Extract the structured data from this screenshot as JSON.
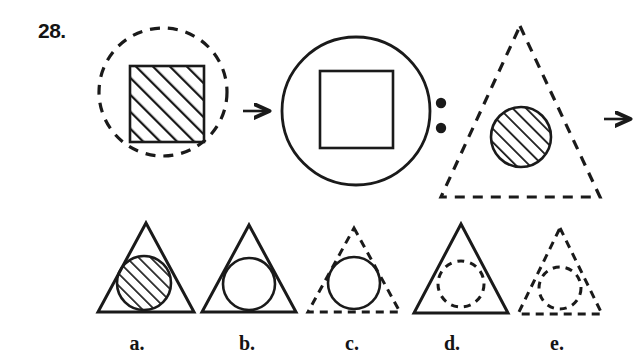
{
  "question": {
    "number_label": "28.",
    "type": "visual-analogy",
    "relation_symbol": ":",
    "transform_arrow": "→"
  },
  "colors": {
    "ink": "#1a1a1a",
    "background": "#ffffff",
    "hatch": "#1a1a1a"
  },
  "prompt": {
    "term1": {
      "name": "dashed-circle-with-hatched-square",
      "outer": {
        "shape": "circle",
        "stroke": "dashed",
        "fill": "none"
      },
      "inner": {
        "shape": "square",
        "stroke": "solid",
        "fill": "diagonal-hatch"
      }
    },
    "term2": {
      "name": "solid-circle-with-plain-square",
      "outer": {
        "shape": "circle",
        "stroke": "solid",
        "fill": "none"
      },
      "inner": {
        "shape": "square",
        "stroke": "solid",
        "fill": "none"
      }
    },
    "term3": {
      "name": "dashed-triangle-with-hatched-circle",
      "outer": {
        "shape": "triangle",
        "stroke": "dashed",
        "fill": "none"
      },
      "inner": {
        "shape": "circle",
        "stroke": "solid",
        "fill": "diagonal-hatch"
      }
    },
    "term4": {
      "name": "unknown-answer",
      "display": "?"
    }
  },
  "options": [
    {
      "key": "a",
      "label": "a.",
      "outer": {
        "shape": "triangle",
        "stroke": "solid",
        "fill": "none"
      },
      "inner": {
        "shape": "circle",
        "stroke": "solid",
        "fill": "diagonal-hatch"
      }
    },
    {
      "key": "b",
      "label": "b.",
      "outer": {
        "shape": "triangle",
        "stroke": "solid",
        "fill": "none"
      },
      "inner": {
        "shape": "circle",
        "stroke": "solid",
        "fill": "none"
      }
    },
    {
      "key": "c",
      "label": "c.",
      "outer": {
        "shape": "triangle",
        "stroke": "dashed",
        "fill": "none"
      },
      "inner": {
        "shape": "circle",
        "stroke": "solid",
        "fill": "none"
      }
    },
    {
      "key": "d",
      "label": "d.",
      "outer": {
        "shape": "triangle",
        "stroke": "solid",
        "fill": "none"
      },
      "inner": {
        "shape": "circle",
        "stroke": "dashed",
        "fill": "none"
      }
    },
    {
      "key": "e",
      "label": "e.",
      "outer": {
        "shape": "triangle",
        "stroke": "dashed",
        "fill": "none"
      },
      "inner": {
        "shape": "circle",
        "stroke": "dashed",
        "fill": "none"
      }
    }
  ]
}
